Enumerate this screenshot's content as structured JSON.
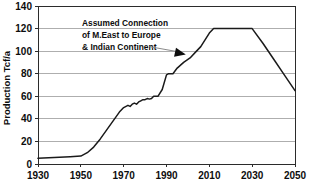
{
  "chart_data": {
    "type": "line",
    "title": "",
    "xlabel": "",
    "ylabel": "Production Tcf/a",
    "xlim": [
      1930,
      2050
    ],
    "ylim": [
      0,
      140
    ],
    "xticks": [
      1930,
      1950,
      1970,
      1990,
      2010,
      2030,
      2050
    ],
    "yticks": [
      0,
      20,
      40,
      60,
      80,
      100,
      120,
      140
    ],
    "grid": "horizontal",
    "legend": "none",
    "series": [
      {
        "name": "Production",
        "color": "#1a1a1a",
        "x": [
          1930,
          1935,
          1940,
          1945,
          1950,
          1953,
          1956,
          1959,
          1962,
          1965,
          1968,
          1970,
          1972,
          1973,
          1974,
          1975,
          1976,
          1977,
          1978,
          1979,
          1980,
          1981,
          1982,
          1983,
          1984,
          1986,
          1988,
          1990,
          1991,
          1992,
          1993,
          1995,
          1998,
          2001,
          2004,
          2006,
          2008,
          2010,
          2012,
          2020,
          2030,
          2035,
          2040,
          2045,
          2050
        ],
        "y": [
          5,
          5.5,
          6,
          6.5,
          7,
          10,
          15,
          22,
          30,
          38,
          46,
          50,
          52,
          51,
          53,
          54,
          53,
          55,
          56,
          57,
          57,
          58,
          57.5,
          58,
          60,
          60,
          66,
          79,
          80,
          80,
          80,
          85,
          90,
          94,
          100,
          104,
          110,
          116,
          120,
          120,
          120,
          107,
          93,
          79,
          65
        ]
      }
    ],
    "annotations": [
      {
        "name": "assumed-connection-note",
        "lines": [
          "Assumed Connection",
          "of M.East to Europe",
          "& Indian Continent"
        ],
        "arrow": {
          "from_x": 1982,
          "from_y": 104,
          "to_x": 1999,
          "to_y": 97
        }
      }
    ]
  },
  "axes": {
    "ylabel": "Production Tcf/a",
    "ytick_labels": [
      "0",
      "20",
      "40",
      "60",
      "80",
      "100",
      "120",
      "140"
    ],
    "xtick_labels": [
      "1930",
      "1950",
      "1970",
      "1990",
      "2010",
      "2030",
      "2050"
    ]
  },
  "annotation": {
    "line1": "Assumed Connection",
    "line2": "of M.East to Europe",
    "line3": "& Indian Continent"
  },
  "colors": {
    "line": "#1a1a1a",
    "grid": "#9a9a9a",
    "frame": "#2b2b2b",
    "text": "#0d0d0d",
    "leader": "#8a8a8a",
    "background": "#ffffff"
  }
}
